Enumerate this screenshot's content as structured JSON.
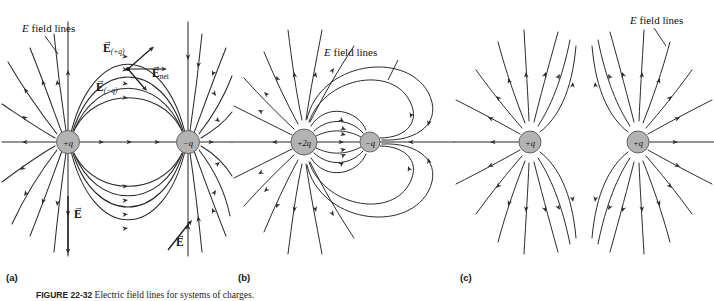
{
  "figure": {
    "caption_number": "FIGURE 22-32",
    "caption_text": "Electric field lines for systems of charges.",
    "panels": [
      {
        "id": "a",
        "sublabel": "(a)",
        "description": "Electric dipole: equal and opposite charges",
        "field_lines_label": "E field lines",
        "charges": [
          {
            "label": "+q",
            "sign": "positive",
            "magnitude": 1
          },
          {
            "label": "−q",
            "sign": "negative",
            "magnitude": 1
          }
        ],
        "vectors": [
          {
            "symbol": "E",
            "subscript": "(+q)",
            "name": "field-from-positive-charge"
          },
          {
            "symbol": "E",
            "subscript": "(−q)",
            "name": "field-from-negative-charge"
          },
          {
            "symbol": "E",
            "subscript": "net",
            "name": "net-field"
          },
          {
            "symbol": "E",
            "subscript": "",
            "name": "field-vector-lower-left"
          },
          {
            "symbol": "E",
            "subscript": "",
            "name": "field-vector-lower-right"
          }
        ]
      },
      {
        "id": "b",
        "sublabel": "(b)",
        "description": "Unequal opposite charges +2q and -q",
        "field_lines_label": "E field lines",
        "charges": [
          {
            "label": "+2q",
            "sign": "positive",
            "magnitude": 2
          },
          {
            "label": "−q",
            "sign": "negative",
            "magnitude": 1
          }
        ],
        "vectors": []
      },
      {
        "id": "c",
        "sublabel": "(c)",
        "description": "Two equal positive charges",
        "field_lines_label": "E field lines",
        "charges": [
          {
            "label": "+q",
            "sign": "positive",
            "magnitude": 1
          },
          {
            "label": "+q",
            "sign": "positive",
            "magnitude": 1
          }
        ],
        "vectors": []
      }
    ],
    "colors": {
      "line": "#2b2b2b",
      "charge_fill": "#b3b3b3",
      "charge_stroke": "#4a4a4a",
      "background": "#ffffff",
      "text": "#111111"
    }
  }
}
